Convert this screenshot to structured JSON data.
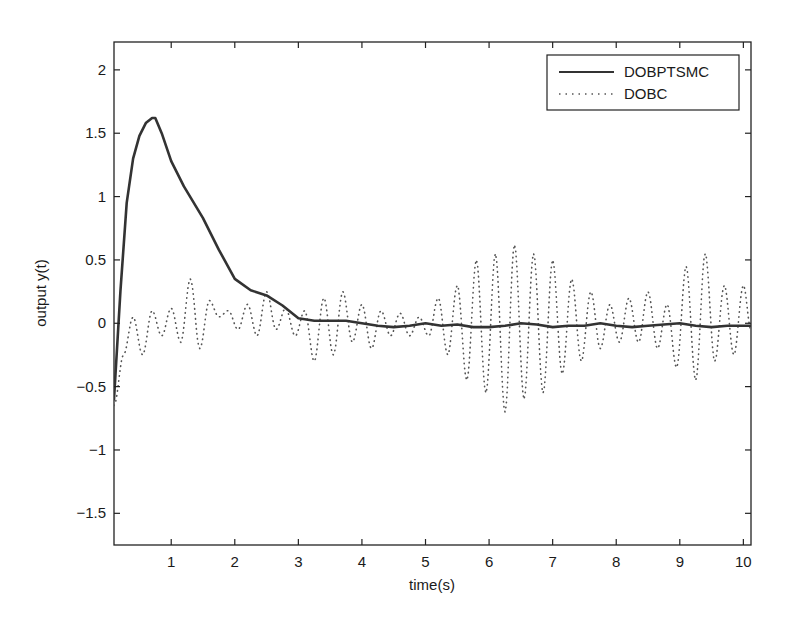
{
  "chart_data": {
    "type": "line",
    "title": "",
    "xlabel": "time(s)",
    "ylabel": "output y(t)",
    "xlim": [
      0.1,
      10.12
    ],
    "ylim": [
      -1.75,
      2.22
    ],
    "xticks": [
      1,
      2,
      3,
      4,
      5,
      6,
      7,
      8,
      9,
      10
    ],
    "xtick_labels": [
      "1",
      "2",
      "3",
      "4",
      "5",
      "6",
      "7",
      "8",
      "9",
      "10"
    ],
    "yticks": [
      -1.5,
      -1,
      -0.5,
      0,
      0.5,
      1,
      1.5,
      2
    ],
    "ytick_labels": [
      "−1.5",
      "−1",
      "−0.5",
      "0",
      "0.5",
      "1",
      "1.5",
      "2"
    ],
    "grid": false,
    "legend_position": "upper right",
    "series": [
      {
        "name": "DOBPTSMC",
        "style": "solid",
        "color": "#333333",
        "x": [
          0.1,
          0.2,
          0.3,
          0.4,
          0.5,
          0.6,
          0.7,
          0.75,
          0.85,
          1.0,
          1.2,
          1.5,
          1.75,
          2.0,
          2.25,
          2.5,
          2.75,
          3.0,
          3.25,
          3.5,
          3.75,
          4.0,
          4.25,
          4.5,
          4.75,
          5.0,
          5.25,
          5.5,
          5.75,
          6.0,
          6.25,
          6.5,
          6.75,
          7.0,
          7.25,
          7.5,
          7.75,
          8.0,
          8.25,
          8.5,
          8.75,
          9.0,
          9.25,
          9.5,
          9.75,
          10.0,
          10.12
        ],
        "y": [
          -0.6,
          0.25,
          0.95,
          1.3,
          1.48,
          1.58,
          1.62,
          1.62,
          1.5,
          1.28,
          1.08,
          0.83,
          0.58,
          0.35,
          0.26,
          0.22,
          0.14,
          0.04,
          0.02,
          0.02,
          0.02,
          0.0,
          -0.02,
          -0.03,
          -0.02,
          0.0,
          -0.02,
          -0.01,
          -0.03,
          -0.03,
          -0.02,
          0.0,
          -0.01,
          -0.03,
          -0.02,
          -0.02,
          0.0,
          -0.02,
          -0.03,
          -0.02,
          -0.01,
          0.0,
          -0.02,
          -0.03,
          -0.02,
          -0.02,
          -0.02
        ]
      },
      {
        "name": "DOBC",
        "style": "dotted",
        "color": "#555555",
        "x": [
          0.1,
          0.25,
          0.4,
          0.55,
          0.7,
          0.85,
          1.0,
          1.15,
          1.3,
          1.45,
          1.6,
          1.75,
          1.9,
          2.05,
          2.2,
          2.35,
          2.5,
          2.65,
          2.8,
          2.95,
          3.1,
          3.25,
          3.4,
          3.55,
          3.7,
          3.85,
          4.0,
          4.15,
          4.3,
          4.45,
          4.6,
          4.75,
          4.9,
          5.05,
          5.2,
          5.35,
          5.5,
          5.65,
          5.8,
          5.95,
          6.1,
          6.25,
          6.4,
          6.55,
          6.7,
          6.85,
          7.0,
          7.15,
          7.3,
          7.45,
          7.6,
          7.75,
          7.9,
          8.05,
          8.2,
          8.35,
          8.5,
          8.65,
          8.8,
          8.95,
          9.1,
          9.25,
          9.4,
          9.55,
          9.7,
          9.85,
          10.0,
          10.12
        ],
        "y": [
          -0.65,
          -0.25,
          0.05,
          -0.25,
          0.1,
          -0.1,
          0.12,
          -0.15,
          0.35,
          -0.2,
          0.18,
          0.05,
          0.1,
          -0.05,
          0.15,
          -0.1,
          0.25,
          -0.05,
          0.12,
          -0.1,
          0.1,
          -0.3,
          0.2,
          -0.25,
          0.25,
          -0.15,
          0.15,
          -0.2,
          0.1,
          -0.1,
          0.08,
          -0.1,
          0.05,
          -0.1,
          0.2,
          -0.25,
          0.3,
          -0.45,
          0.5,
          -0.55,
          0.55,
          -0.7,
          0.62,
          -0.6,
          0.55,
          -0.55,
          0.5,
          -0.4,
          0.35,
          -0.3,
          0.25,
          -0.2,
          0.15,
          -0.15,
          0.2,
          -0.15,
          0.25,
          -0.2,
          0.15,
          -0.35,
          0.45,
          -0.45,
          0.55,
          -0.3,
          0.3,
          -0.25,
          0.3,
          -0.05
        ]
      }
    ]
  },
  "legend": {
    "entries": [
      {
        "label": "DOBPTSMC",
        "style": "solid"
      },
      {
        "label": "DOBC",
        "style": "dotted"
      }
    ]
  },
  "axes": {
    "xlabel": "time(s)",
    "ylabel": "output y(t)"
  }
}
